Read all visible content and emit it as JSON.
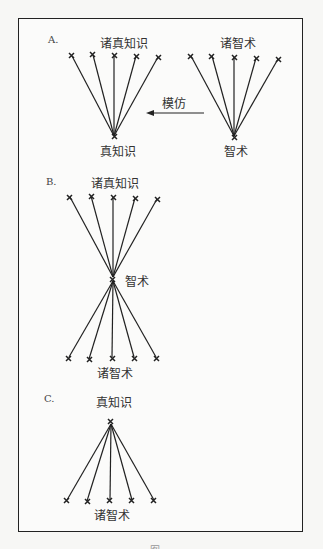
{
  "sections": {
    "A": {
      "label": "A.",
      "left_group_top": "诸真知识",
      "left_group_bottom": "真知识",
      "right_group_top": "诸智术",
      "right_group_bottom": "智术",
      "arrow_label": "模仿"
    },
    "B": {
      "label": "B.",
      "top": "诸真知识",
      "middle": "智术",
      "bottom": "诸智术"
    },
    "C": {
      "label": "C.",
      "top": "真知识",
      "bottom": "诸智术"
    }
  },
  "caption": "图"
}
